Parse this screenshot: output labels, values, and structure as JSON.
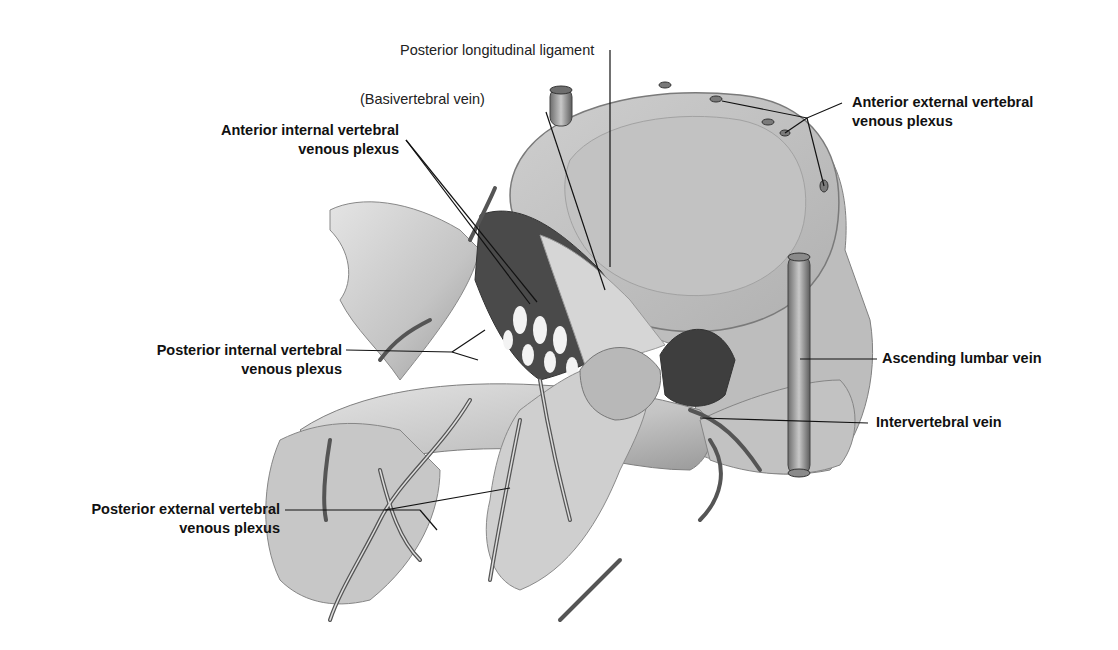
{
  "figure": {
    "colors": {
      "ink": "#111111",
      "bone_light": "#d9d9d9",
      "bone_mid": "#b5b5b5",
      "bone_dark": "#7a7a7a",
      "vein": "#5a5a5a",
      "background": "#ffffff"
    }
  },
  "labels": {
    "posterior_longitudinal_ligament": "Posterior longitudinal ligament",
    "basivertebral_vein": "(Basivertebral vein)",
    "anterior_internal_line1": "Anterior internal vertebral",
    "anterior_internal_line2": "venous plexus",
    "anterior_external_line1": "Anterior external vertebral",
    "anterior_external_line2": "venous plexus",
    "posterior_internal_line1": "Posterior internal vertebral",
    "posterior_internal_line2": "venous plexus",
    "ascending_lumbar_vein": "Ascending lumbar vein",
    "intervertebral_vein": "Intervertebral vein",
    "posterior_external_line1": "Posterior external vertebral",
    "posterior_external_line2": "venous plexus"
  }
}
